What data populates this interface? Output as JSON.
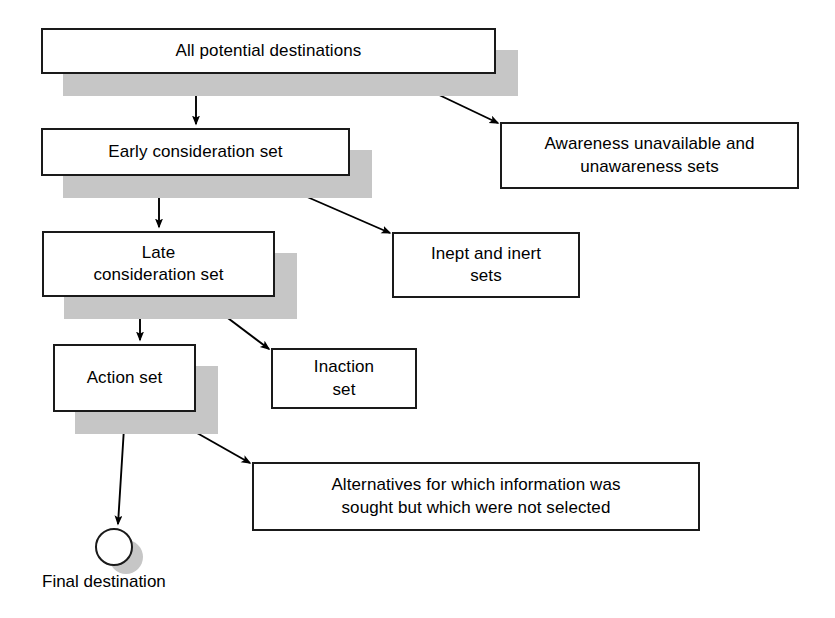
{
  "diagram": {
    "colors": {
      "box_border": "#1a1a1a",
      "box_fill": "#ffffff",
      "shadow": "#c6c6c6",
      "arrow": "#000000",
      "background": "#ffffff"
    },
    "nodes": [
      {
        "id": "all-potential-destinations",
        "label": "All potential destinations",
        "x": 41,
        "y": 28,
        "w": 455,
        "h": 46,
        "shadow": true
      },
      {
        "id": "awareness-unavailable-and-unawareness-sets",
        "label": "Awareness unavailable and\nunawareness sets",
        "x": 500,
        "y": 122,
        "w": 299,
        "h": 67,
        "shadow": false
      },
      {
        "id": "early-consideration-set",
        "label": "Early consideration set",
        "x": 41,
        "y": 128,
        "w": 309,
        "h": 48,
        "shadow": true
      },
      {
        "id": "inept-and-inert-sets",
        "label": "Inept and inert\nsets",
        "x": 392,
        "y": 232,
        "w": 188,
        "h": 66,
        "shadow": false
      },
      {
        "id": "late-consideration-set",
        "label": "Late\nconsideration set",
        "x": 42,
        "y": 231,
        "w": 233,
        "h": 66,
        "shadow": true
      },
      {
        "id": "inaction-set",
        "label": "Inaction\nset",
        "x": 271,
        "y": 348,
        "w": 146,
        "h": 61,
        "shadow": false
      },
      {
        "id": "action-set",
        "label": "Action set",
        "x": 53,
        "y": 344,
        "w": 143,
        "h": 68,
        "shadow": true
      },
      {
        "id": "alternatives-not-selected",
        "label": "Alternatives for which information was\nsought but which were not selected",
        "x": 252,
        "y": 462,
        "w": 448,
        "h": 69,
        "shadow": false
      }
    ],
    "terminal": {
      "id": "final-destination",
      "caption": "Final destination",
      "circle": {
        "cx": 112,
        "cy": 545,
        "r": 17
      },
      "shadow_circle": {
        "cx": 126,
        "cy": 557,
        "r": 17
      },
      "caption_x": 42,
      "caption_y": 572
    },
    "edges": [
      {
        "id": "all-to-early",
        "from": "all-potential-destinations",
        "to": "early-consideration-set",
        "points": "196,74 196,124"
      },
      {
        "id": "all-to-awareness",
        "from": "all-potential-destinations",
        "to": "awareness-unavailable-and-unawareness-sets",
        "points": "395,74 498,123"
      },
      {
        "id": "early-to-late",
        "from": "early-consideration-set",
        "to": "late-consideration-set",
        "points": "159,176 159,227"
      },
      {
        "id": "early-to-inept",
        "from": "early-consideration-set",
        "to": "inept-and-inert-sets",
        "points": "259,176 390,233"
      },
      {
        "id": "late-to-action",
        "from": "late-consideration-set",
        "to": "action-set",
        "points": "140,297 140,340"
      },
      {
        "id": "late-to-inaction",
        "from": "late-consideration-set",
        "to": "inaction-set",
        "points": "200,297 269,349"
      },
      {
        "id": "action-to-final",
        "from": "action-set",
        "to": "final-destination",
        "points": "125,412 118,524"
      },
      {
        "id": "action-to-alternatives",
        "from": "action-set",
        "to": "alternatives-not-selected",
        "points": "160,412 250,463"
      }
    ]
  }
}
